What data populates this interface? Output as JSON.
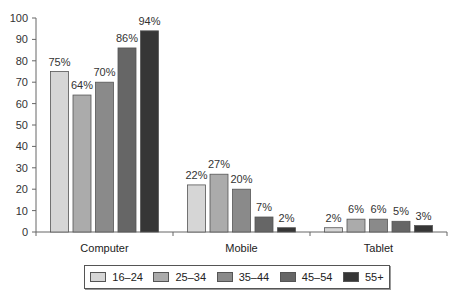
{
  "chart_data": {
    "type": "bar",
    "title": "",
    "xlabel": "",
    "ylabel": "",
    "ylim": [
      0,
      100
    ],
    "yticks": [
      0,
      10,
      20,
      30,
      40,
      50,
      60,
      70,
      80,
      90,
      100
    ],
    "categories": [
      "Computer",
      "Mobile",
      "Tablet"
    ],
    "series": [
      {
        "name": "16–24",
        "color": "#d6d6d6",
        "values": [
          75,
          22,
          2
        ]
      },
      {
        "name": "25–34",
        "color": "#ababab",
        "values": [
          64,
          27,
          6
        ]
      },
      {
        "name": "35–44",
        "color": "#8a8a8a",
        "values": [
          70,
          20,
          6
        ]
      },
      {
        "name": "45–54",
        "color": "#666666",
        "values": [
          86,
          7,
          5
        ]
      },
      {
        "name": "55+",
        "color": "#363636",
        "values": [
          94,
          2,
          3
        ]
      }
    ],
    "data_label_suffix": "%",
    "grid": false,
    "legend_position": "bottom"
  }
}
